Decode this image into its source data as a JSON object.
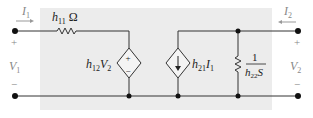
{
  "diagram": {
    "colors": {
      "box": "#ececec",
      "wire": "#333333",
      "node": "#111111",
      "terminal_label": "#8a8a8a"
    },
    "port1": {
      "current_label": "I",
      "current_sub": "1",
      "voltage_label": "V",
      "voltage_sub": "1",
      "plus": "+",
      "minus": "−"
    },
    "port2": {
      "current_label": "I",
      "current_sub": "2",
      "voltage_label": "V",
      "voltage_sub": "2",
      "plus": "+",
      "minus": "−"
    },
    "resistor_h11": {
      "label": "h",
      "sub": "11",
      "unit": " Ω"
    },
    "source_h12": {
      "label_h": "h",
      "sub_h": "12",
      "label_v": "V",
      "sub_v": "2",
      "plus": "+",
      "minus": "−"
    },
    "source_h21": {
      "label_h": "h",
      "sub_h": "21",
      "label_i": "I",
      "sub_i": "1"
    },
    "resistor_h22": {
      "numerator": "1",
      "den_h": "h",
      "den_sub": "22",
      "den_unit": "S"
    }
  }
}
